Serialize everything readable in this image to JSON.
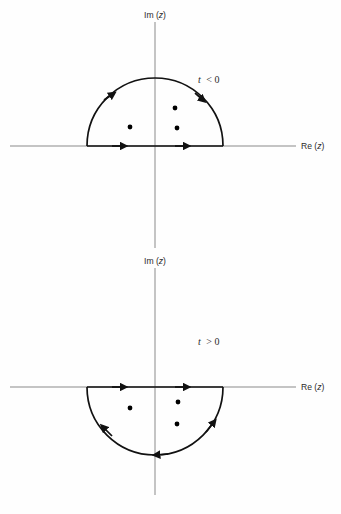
{
  "figure": {
    "background_color": "#fefefe",
    "axis_color": "#8a8a8a",
    "contour_color": "#111111",
    "pole_color": "#000000"
  },
  "panels": [
    {
      "id": "upper-panel",
      "name": "t-less-than-zero-panel",
      "condition_label": "t < 0",
      "condition_symbol_variable": "t",
      "condition_symbol_relation": "<",
      "condition_symbol_value": "0",
      "im_axis_label_prefix": "Im (",
      "im_axis_label_variable": "z",
      "im_axis_label_suffix": ")",
      "re_axis_label_prefix": "Re (",
      "re_axis_label_variable": "z",
      "re_axis_label_suffix": ")",
      "contour_half": "upper",
      "contour_orientation": "counterclockwise",
      "origin": {
        "x": 155,
        "y": 146
      },
      "radius": 68,
      "poles": [
        {
          "name": "pole-left",
          "x": 130,
          "y": 127
        },
        {
          "name": "pole-upper-right",
          "x": 175,
          "y": 108
        },
        {
          "name": "pole-lower-right",
          "x": 177,
          "y": 128
        }
      ],
      "arrows": [
        {
          "name": "arrow-segment-left",
          "x": 122,
          "y": 146,
          "direction": "right"
        },
        {
          "name": "arrow-segment-right",
          "x": 185,
          "y": 146,
          "direction": "right"
        },
        {
          "name": "arrow-arc-left",
          "position_deg": 150,
          "direction": "counterclockwise"
        },
        {
          "name": "arrow-arc-right",
          "position_deg": 33,
          "direction": "counterclockwise"
        }
      ]
    },
    {
      "id": "lower-panel",
      "name": "t-greater-than-zero-panel",
      "condition_label": "t > 0",
      "condition_symbol_variable": "t",
      "condition_symbol_relation": ">",
      "condition_symbol_value": "0",
      "im_axis_label_prefix": "Im (",
      "im_axis_label_variable": "z",
      "im_axis_label_suffix": ")",
      "re_axis_label_prefix": "Re (",
      "re_axis_label_variable": "z",
      "re_axis_label_suffix": ")",
      "contour_half": "lower",
      "contour_orientation": "clockwise",
      "origin": {
        "x": 155,
        "y": 387
      },
      "radius": 68,
      "poles": [
        {
          "name": "pole-left",
          "x": 130,
          "y": 408
        },
        {
          "name": "pole-upper-right",
          "x": 178,
          "y": 402
        },
        {
          "name": "pole-lower-right",
          "x": 177,
          "y": 424
        }
      ],
      "arrows": [
        {
          "name": "arrow-segment-left",
          "x": 122,
          "y": 387,
          "direction": "right"
        },
        {
          "name": "arrow-segment-right",
          "x": 185,
          "y": 387,
          "direction": "right"
        },
        {
          "name": "arrow-arc-left",
          "position_deg": 205,
          "direction": "clockwise"
        },
        {
          "name": "arrow-arc-right",
          "position_deg": 330,
          "direction": "clockwise"
        },
        {
          "name": "arrow-arc-bottom",
          "position_deg": 268,
          "direction": "clockwise"
        }
      ]
    }
  ],
  "chart_data": {
    "type": "diagram",
    "xlabel": "Re (z)",
    "ylabel": "Im (z)",
    "annotations": [
      "t < 0",
      "t > 0"
    ],
    "series": [
      {
        "name": "upper contour (t < 0)",
        "half": "upper",
        "orientation": "counterclockwise",
        "radius": 68,
        "poles": [
          [
            -25,
            19
          ],
          [
            20,
            38
          ],
          [
            22,
            18
          ]
        ]
      },
      {
        "name": "lower contour (t > 0)",
        "half": "lower",
        "orientation": "clockwise",
        "radius": 68,
        "poles": [
          [
            -25,
            -21
          ],
          [
            23,
            -15
          ],
          [
            22,
            -37
          ]
        ]
      }
    ],
    "grid": false,
    "legend": "none"
  }
}
